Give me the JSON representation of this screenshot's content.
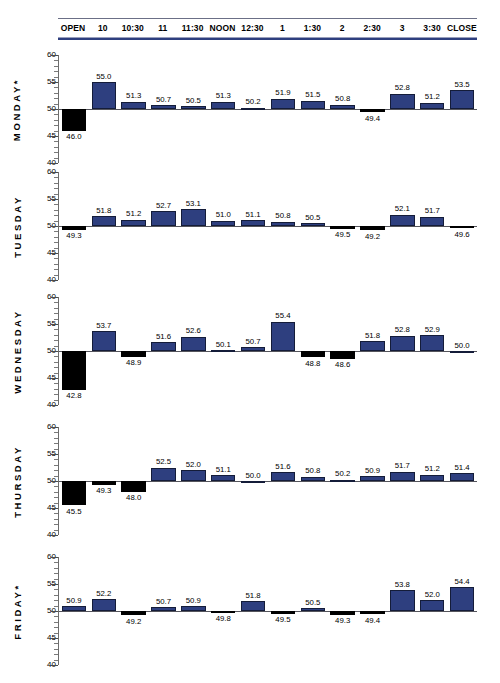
{
  "header": {
    "columns": [
      "OPEN",
      "10",
      "10:30",
      "11",
      "11:30",
      "NOON",
      "12:30",
      "1",
      "1:30",
      "2",
      "2:30",
      "3",
      "3:30",
      "CLOSE"
    ]
  },
  "axis": {
    "ticks": [
      "60",
      "55",
      "50",
      "45",
      "40"
    ]
  },
  "colors": {
    "bar_up": "#2e3f7f",
    "bar_down": "#000000",
    "header_rule": "#2e3f7f",
    "baseline": "#55555c"
  },
  "chart_data": {
    "type": "bar",
    "title": "",
    "xlabel": "",
    "ylabel": "",
    "ylim": [
      40,
      60
    ],
    "baseline": 50,
    "grid": false,
    "legend": "none",
    "categories": [
      "OPEN",
      "10",
      "10:30",
      "11",
      "11:30",
      "NOON",
      "12:30",
      "1",
      "1:30",
      "2",
      "2:30",
      "3",
      "3:30",
      "CLOSE"
    ],
    "series": [
      {
        "name": "MONDAY*",
        "values": [
          46.0,
          55.0,
          51.3,
          50.7,
          50.5,
          51.3,
          50.2,
          51.9,
          51.5,
          50.8,
          49.4,
          52.8,
          51.2,
          53.5
        ]
      },
      {
        "name": "TUESDAY",
        "values": [
          49.3,
          51.8,
          51.2,
          52.7,
          53.1,
          51.0,
          51.1,
          50.8,
          50.5,
          49.5,
          49.2,
          52.1,
          51.7,
          49.6
        ]
      },
      {
        "name": "WEDNESDAY",
        "values": [
          42.8,
          53.7,
          48.9,
          51.6,
          52.6,
          50.1,
          50.7,
          55.4,
          48.8,
          48.6,
          51.8,
          52.8,
          52.9,
          50.0
        ]
      },
      {
        "name": "THURSDAY",
        "values": [
          45.5,
          49.3,
          48.0,
          52.5,
          52.0,
          51.1,
          50.0,
          51.6,
          50.8,
          50.2,
          50.9,
          51.7,
          51.2,
          51.4
        ]
      },
      {
        "name": "FRIDAY*",
        "values": [
          50.9,
          52.2,
          49.2,
          50.7,
          50.9,
          49.8,
          51.8,
          49.5,
          50.5,
          49.3,
          49.4,
          53.8,
          52.0,
          54.4
        ]
      }
    ]
  }
}
